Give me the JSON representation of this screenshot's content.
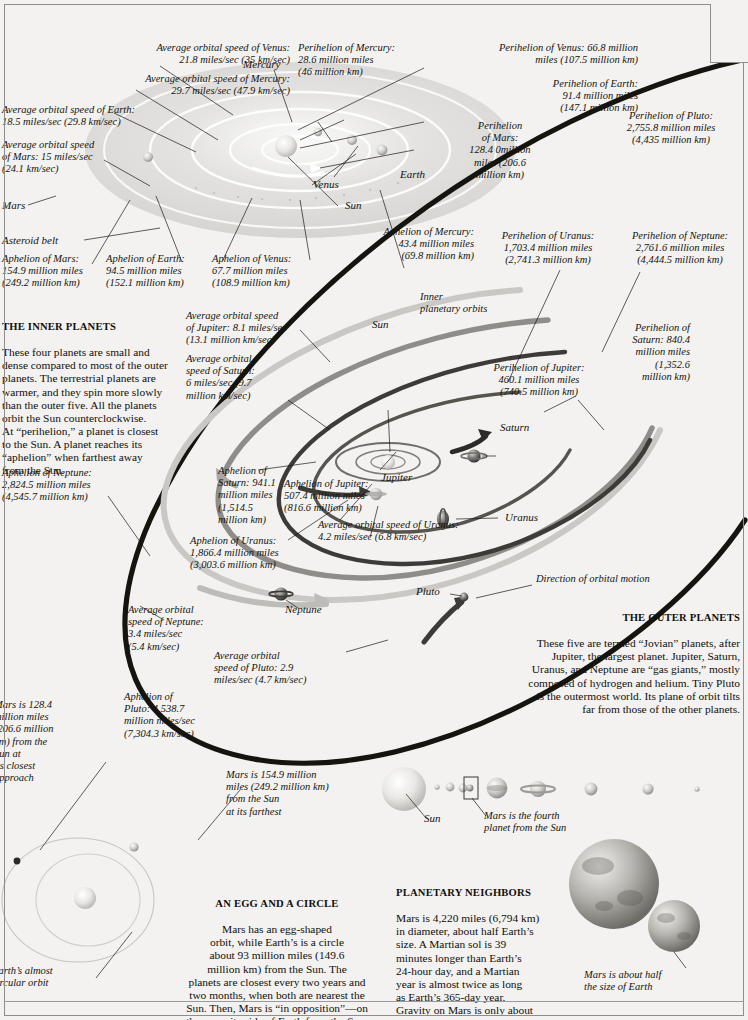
{
  "inner_labels": {
    "venus_speed": "Average orbital speed of Venus:\n21.8 miles/sec (35 km/sec)",
    "mercury_speed": "Average orbital speed of Mercury:\n29.7 miles/sec (47.9 km/sec)",
    "earth_speed": "Average orbital speed of Earth:\n18.5 miles/sec (29.8 km/sec)",
    "mars_speed": "Average orbital speed\nof Mars: 15 miles/sec\n(24.1 km/sec)",
    "mercury_name": "Mercury",
    "venus_name": "Venus",
    "earth_name": "Earth",
    "sun_name": "Sun",
    "mars_name": "Mars",
    "asteroid_belt": "Asteroid belt",
    "perihelion_mercury": "Perihelion of Mercury:\n28.6 million miles\n(46 million km)",
    "perihelion_venus": "Perihelion of Venus: 66.8 million\nmiles (107.5 million km)",
    "perihelion_earth": "Perihelion of Earth:\n91.4 million miles\n(147.1 million km)",
    "perihelion_mars": "Perihelion\nof Mars:\n128.4 0million\nmiles (206.6\nmillion km)",
    "perihelion_pluto": "Perihelion of Pluto:\n2,755.8 million miles\n(4,435 million km)",
    "aphelion_mars": "Aphelion of Mars:\n154.9 million miles\n(249.2 million km)",
    "aphelion_earth": "Aphelion of Earth:\n94.5 million miles\n(152.1 million km)",
    "aphelion_venus": "Aphelion of Venus:\n67.7 million miles\n(108.9 million km)",
    "aphelion_mercury": "Aphelion of Mercury:\n43.4 million miles\n(69.8 million km)"
  },
  "inner_planets_block": {
    "heading": "THE INNER PLANETS",
    "text": "These four planets are small and\ndense compared to most of the outer\nplanets. The terrestrial planets are\nwarmer, and they spin more slowly\nthan the outer five. All the planets\norbit the Sun counterclockwise.\nAt “perihelion,” a planet is closest\nto the Sun. A planet reaches its\n“aphelion” when farthest away\nfrom the Sun."
  },
  "outer_planets_block": {
    "heading": "THE OUTER PLANETS",
    "text": "These five are termed “Jovian” planets, after\nJupiter, the largest planet. Jupiter, Saturn,\nUranus, and Neptune are “gas giants,” mostly\ncomposed of hydrogen and helium. Tiny Pluto\nis the outermost world. Its plane of orbit tilts\nfar from those of the other planets."
  },
  "outer_labels": {
    "jupiter_speed": "Average orbital speed\nof Jupiter: 8.1 miles/sec\n(13.1 million km/sec)",
    "saturn_speed": "Average orbital\nspeed of Saturn:\n6 miles/sec (9.7\nmillion km/sec)",
    "uranus_speed": "Average orbital speed of Uranus:\n4.2 miles/sec (6.8 km/sec)",
    "neptune_speed": "Average orbital\nspeed of Neptune:\n3.4 miles/sec\n(5.4 km/sec)",
    "pluto_speed": "Average orbital\nspeed of Pluto: 2.9\nmiles/sec (4.7 km/sec)",
    "perihelion_jupiter": "Perihelion of Jupiter:\n460.1 million miles\n(740.5 million km)",
    "perihelion_saturn": "Perihelion of\nSaturn: 840.4\nmillion miles\n(1,352.6\nmillion km)",
    "perihelion_uranus": "Perihelion of Uranus:\n1,703.4 million miles\n(2,741.3 million km)",
    "perihelion_neptune": "Perihelion of Neptune:\n2,761.6 million miles\n(4,444.5 million km)",
    "aphelion_jupiter": "Aphelion of Jupiter:\n507.4 million miles\n(816.6 million km)",
    "aphelion_saturn": "Aphelion of\nSaturn: 941.1\nmillion miles\n(1,514.5\nmillion km)",
    "aphelion_uranus": "Aphelion of Uranus:\n1,866.4 million miles\n(3,003.6 million km)",
    "aphelion_neptune": "Aphelion of Neptune:\n2,824.5 million miles\n(4,545.7 million km)",
    "aphelion_pluto": "Aphelion of\nPluto: 4,538.7\nmillion miles/sec\n(7,304.3 km/sec)",
    "sun_name": "Sun",
    "inner_orbits": "Inner\nplanetary orbits",
    "jupiter_name": "Jupiter",
    "saturn_name": "Saturn",
    "uranus_name": "Uranus",
    "neptune_name": "Neptune",
    "pluto_name": "Pluto",
    "direction": "Direction of orbital motion"
  },
  "mars_orbit": {
    "closest": "Mars is 128.4\nmillion miles\n(206.6 million\nkm) from the\nSun at\nits closest\napproach",
    "farthest": "Mars is 154.9 million\nmiles (249.2 million km)\nfrom the Sun\nat its farthest",
    "earth_orbit": "Earth’s almost\ncircular orbit"
  },
  "egg_block": {
    "heading": "AN EGG AND A CIRCLE",
    "text": "Mars has an egg-shaped\norbit, while Earth’s is a circle\nabout 93 million miles (149.6\nmillion km) from the Sun. The\nplanets are closest every two years and\ntwo months, when both are nearest the\nSun. Then, Mars is “in opposition”—on\nthe opposite side of Earth from the Sun."
  },
  "neighbors_block": {
    "heading": "PLANETARY NEIGHBORS",
    "text": "Mars is 4,220 miles (6,794 km)\nin diameter, about half Earth’s\nsize. A Martian sol is 39\nminutes longer than Earth’s\n24-hour day, and a Martian\nyear is almost twice as long\nas Earth’s 365-day year.\nGravity on Mars is only about\none-third as strong as Earth’s."
  },
  "size_row": {
    "sun_label": "Sun",
    "mars_label": "Mars is the fourth\nplanet from the Sun"
  },
  "mars_earth_caption": "Mars is about half\nthe size of Earth"
}
